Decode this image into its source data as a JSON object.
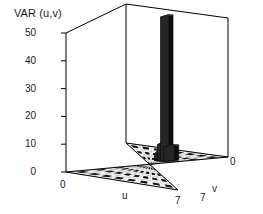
{
  "chart_data": {
    "type": "bar",
    "render": "3d-bar",
    "title": "VAR (u,v)",
    "zlabel": "VAR (u,v)",
    "xlabel": "u",
    "ylabel": "v",
    "zlim": [
      0,
      50
    ],
    "zticks": [
      0,
      10,
      20,
      30,
      40,
      50
    ],
    "ztick_labels": [
      "0",
      "10",
      "20",
      "30",
      "40",
      "50"
    ],
    "xlim": [
      0,
      7
    ],
    "xtick_labels": [
      "0",
      "7"
    ],
    "ylim": [
      0,
      7
    ],
    "ytick_labels": [
      "7",
      "0"
    ],
    "grid": true,
    "grid_cells": 8,
    "legend": null,
    "bar_color": "#0d0d0d",
    "axis_color": "#000000",
    "bars": [
      {
        "u": 1,
        "v": 5,
        "value": 5.5
      },
      {
        "u": 2,
        "v": 5,
        "value": 52.0
      },
      {
        "u": 3,
        "v": 5,
        "value": 6.0
      },
      {
        "u": 4,
        "v": 5,
        "value": 2.5
      }
    ]
  },
  "axes": {
    "title": "VAR (u,v)",
    "z_ticks": [
      "50",
      "40",
      "30",
      "20",
      "10",
      "0"
    ],
    "x_axis_name": "u",
    "y_axis_name": "v",
    "x_origin_label": "0",
    "x_max_label": "7",
    "y_max_label": "7",
    "y_origin_label": "0"
  }
}
